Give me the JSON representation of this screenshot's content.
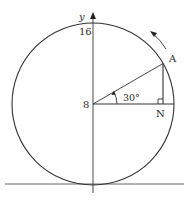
{
  "diagram": {
    "type": "ferris-wheel-circle",
    "colors": {
      "line": "#333333",
      "background": "#ffffff"
    },
    "axis": {
      "label": "y",
      "arrow": "up"
    },
    "labels": {
      "y_axis": "y",
      "top_value": "16",
      "center_value": "8",
      "point_a": "A",
      "point_n": "N",
      "angle": "30°"
    },
    "elements": {
      "circle": {
        "cx": 93,
        "cy": 104,
        "r": 81
      },
      "radius_to_A": {
        "angle_deg": 30
      },
      "right_angle_marker_at": "N",
      "rotation_direction": "counter-clockwise",
      "ground_line": true
    }
  }
}
